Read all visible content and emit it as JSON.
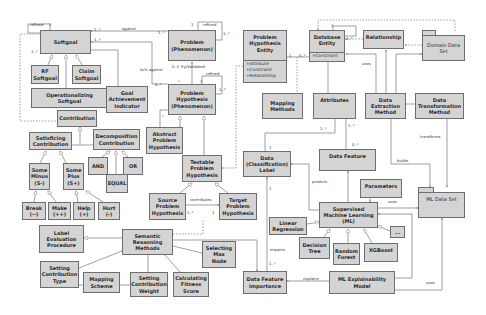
{
  "diagram": {
    "type": "UML class diagram",
    "classes": {
      "softgoal": "Softgoal",
      "rf_softgoal": "RF\nSoftgoal",
      "claim_softgoal": "Claim\nSoftgoal",
      "operationalizing_softgoal": "Operationalizing\nSoftgoal",
      "goal_achievement_indicator": "Goal\nAchievement\nIndicator",
      "contribution": "Contribution",
      "satisficing_contribution": "Satisficing\nContribution",
      "decomposition_contribution": "Decomposition\nContribution",
      "some_minus": "Some\nMinus\n(S-)",
      "some_plus": "Some\nPlus\n(S+)",
      "and": "AND",
      "or": "OR",
      "equal": "EQUAL",
      "break": "Break\n(--)",
      "make": "Make\n(++)",
      "help": "Help\n(+)",
      "hurt": "Hurt\n(-)",
      "problem_phenomenon": "Problem\n(Phenomenon)",
      "problem_hypothesis_phenomenon": "Problem\nHypothesis\n(Phenomenon)",
      "abstract_problem_hypothesis": "Abstract\nProblem\nHypothesis",
      "testable_problem_hypothesis": "Testable\nProblem\nHypothesis",
      "source_problem_hypothesis": "Source\nProblem\nHypothesis",
      "target_problem_hypothesis": "Target\nProblem\nHypothesis",
      "problem_hypothesis_entity": {
        "name": "Problem\nHypothesis\nEntity",
        "attributes": "+Attribute\n+Constraint\n+Relationship"
      },
      "mapping_methods": "Mapping\nMethods",
      "database_entity": {
        "name": "Database\nEntity",
        "attributes": "+Constraint"
      },
      "relationship": "Relationship",
      "domain_data_set": "Domain Data\nSet",
      "attributes": "Attributes",
      "data_extraction_method": "Data\nExtraction\nMethod",
      "data_transformation_method": "Data\nTransformation\nMethod",
      "data_classification_label": "Data\n(Classification)\nLabel",
      "data_feature": "Data Feature",
      "parameters": "Parameters",
      "ml_data_set": "ML Data Set",
      "supervised_ml": "Supervised\nMachine Learning\n(ML)",
      "linear_regression": "Linear\nRegression",
      "decision_tree": "Decision\nTree",
      "random_forest": "Random\nForest",
      "xgboost": "XGBoost",
      "ellipsis": "...",
      "label_evaluation_procedure": "Label\nEvaluation\nProcedure",
      "semantic_reasoning_methods": "Semantic\nReasoning\nMethods",
      "selecting_max_node": "Selecting\nMax\nNode",
      "setting_contribution_type": "Setting\nContribution\nType",
      "mapping_scheme": "Mapping\nScheme",
      "setting_contribution_weight": "Setting\nContribution\nWeight",
      "calculating_fitness_score": "Calculating\nFitness\nScore",
      "data_feature_importance": "Data Feature\nImportance",
      "ml_explainability_model": "ML Explainability\nModel"
    },
    "edge_labels": {
      "refined_softgoal": "refined",
      "softgoal_refined_mult": "1",
      "softgoal_left_mult": "1..*",
      "against": "against",
      "against_mult_left": "1..*",
      "against_mult_right": "1..*",
      "softgoal_mult2": "1..*",
      "refined_problem": "refined",
      "problem_mult_1": "1",
      "problem_mult_2": "1..*",
      "is_against": "Is/Is against",
      "is_against_mult": "0..*",
      "try_invalidated": "0..1 Try/Validated",
      "phh_mult_star": "*",
      "refined_hyp": "refined",
      "hyp_mult_1": "1",
      "hyp_mult_2": "1..*",
      "abstract_mult": "*",
      "contributes": "contributes",
      "contributes_mult_left": "1..*",
      "contributes_mult_right": "1",
      "phe_mult_1": "1",
      "db_mult_0": "0..*",
      "db_self_mult_1": "1",
      "db_self_mult_2": "2..*",
      "uses_db": "uses",
      "attributes_mult": "1..*",
      "attr_feature_mult": "1..*",
      "feature_mult": "0..*",
      "label_mult_top": "1",
      "label_mult_bottom": "1",
      "transforms": "transforms",
      "builds": "builds",
      "predicts": "predicts",
      "uses_params": "uses",
      "impacts": "impacts",
      "impacts_mult": "1..*",
      "explains": "explains",
      "uses_ml": "uses"
    }
  }
}
